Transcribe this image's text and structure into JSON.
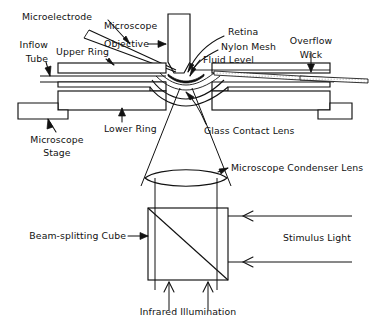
{
  "figure": {
    "kind": "line-diagram",
    "background_color": "#ffffff",
    "ink_color": "#111111"
  },
  "labels": {
    "microelectrode": "Microelectrode",
    "microscope_objective_line1": "Microscope",
    "microscope_objective_line2": "Objective",
    "retina": "Retina",
    "nylon_mesh": "Nylon Mesh",
    "fluid_level": "Fluid Level",
    "overflow_wick_line1": "Overflow",
    "overflow_wick_line2": "Wick",
    "inflow_tube_line1": "Inflow",
    "inflow_tube_line2": "Tube",
    "upper_ring": "Upper Ring",
    "lower_ring": "Lower Ring",
    "microscope_stage_line1": "Microscope",
    "microscope_stage_line2": "Stage",
    "glass_contact_lens": "Glass Contact Lens",
    "microscope_condenser_lens": "Microscope Condenser Lens",
    "beam_splitting_cube": "Beam-splitting Cube",
    "stimulus_light": "Stimulus Light",
    "infrared_illumination": "Infrared Illumination"
  }
}
